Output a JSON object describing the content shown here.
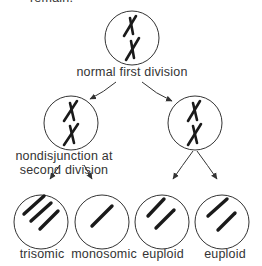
{
  "caption_fragment": "remain.",
  "diagram": {
    "top": {
      "label": "normal first division",
      "chromosome_form": "two X-shaped dyads (sister chromatids joined)"
    },
    "middle_left": {
      "label_line1": "nondisjunction at",
      "label_line2": "second division",
      "chromosome_form": "two X-shaped dyads"
    },
    "middle_right": {
      "chromosome_form": "two X-shaped dyads"
    },
    "bottom": [
      {
        "label": "trisomic",
        "chromatid_count": 3
      },
      {
        "label": "monosomic",
        "chromatid_count": 1
      },
      {
        "label": "euploid",
        "chromatid_count": 2
      },
      {
        "label": "euploid",
        "chromatid_count": 2
      }
    ]
  },
  "colors": {
    "line": "#333333",
    "chromosome": "#1a1a1a",
    "background": "#ffffff"
  }
}
